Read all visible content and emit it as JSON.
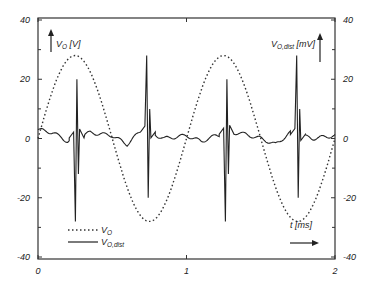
{
  "chart_data": {
    "type": "line",
    "title": "",
    "xlabel": "t [ms]",
    "ylabel_left": "V_O [V]",
    "ylabel_right": "V_O,dist [mV]",
    "xlim": [
      0,
      2
    ],
    "ylim_left": [
      -40,
      40
    ],
    "ylim_right": [
      -40,
      40
    ],
    "x_ticks": [
      "0",
      "1",
      "2"
    ],
    "y_ticks_left": [
      "40",
      "20",
      "0",
      "-20",
      "-40"
    ],
    "y_ticks_right": [
      "40",
      "20",
      "0",
      "-20",
      "-40"
    ],
    "grid": false,
    "legend_position": "lower-left",
    "legend": [
      {
        "name": "V_O",
        "style": "dotted"
      },
      {
        "name": "V_O,dist",
        "style": "solid"
      }
    ],
    "series": [
      {
        "name": "V_O",
        "axis": "left",
        "unit": "V",
        "style": "dotted",
        "description": "sinusoid, amplitude ~28 V, period ~1 ms, peaks near t=0.25 and t=1.25, troughs near t=0.75 and t=1.75",
        "x": [
          0,
          0.25,
          0.5,
          0.75,
          1.0,
          1.25,
          1.5,
          1.75,
          2.0
        ],
        "values": [
          0,
          28,
          0,
          -28,
          0,
          28,
          0,
          -28,
          0
        ]
      },
      {
        "name": "V_O,dist",
        "axis": "right",
        "unit": "mV",
        "style": "solid",
        "description": "distortion waveform near 0 mV with sharp spikes (~+28/-28 mV) near t=0.26, 0.74, 1.27, 1.75",
        "spikes": [
          {
            "t": 0.26,
            "max": 20,
            "min": -28
          },
          {
            "t": 0.74,
            "max": 28,
            "min": -20
          },
          {
            "t": 1.27,
            "max": 20,
            "min": -28
          },
          {
            "t": 1.75,
            "max": 28,
            "min": -20
          }
        ],
        "baseline_x": [
          0,
          0.1,
          0.2,
          0.35,
          0.5,
          0.6,
          0.7,
          0.85,
          1.0,
          1.1,
          1.2,
          1.35,
          1.5,
          1.6,
          1.7,
          1.85,
          2.0
        ],
        "baseline_values": [
          3,
          2,
          -1,
          2,
          1,
          -2,
          3,
          0,
          1,
          -1,
          1,
          2,
          0,
          -2,
          2,
          0,
          1
        ]
      }
    ]
  },
  "labels": {
    "left_axis": "V",
    "left_axis_sub": "O",
    "left_axis_unit": " [V]",
    "right_axis": "V",
    "right_axis_sub": "O,dist",
    "right_axis_unit": " [mV]",
    "x_axis": "t [ms]",
    "legend_vo": "V",
    "legend_vo_sub": "O",
    "legend_vodist": "V",
    "legend_vodist_sub": "O,dist"
  }
}
